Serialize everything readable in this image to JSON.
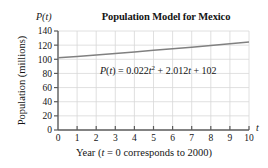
{
  "chart_data": {
    "type": "line",
    "title": "Population Model for Mexico",
    "xlabel": "Year (t = 0 corresponds to 2000)",
    "ylabel": "Population (millions)",
    "x_axis_symbol": "t",
    "y_axis_symbol": "P(t)",
    "xlim": [
      0,
      10
    ],
    "ylim": [
      0,
      140
    ],
    "xticks": [
      "0",
      "1",
      "2",
      "3",
      "4",
      "5",
      "6",
      "7",
      "8",
      "9",
      "10"
    ],
    "yticks": [
      "0",
      "20",
      "40",
      "60",
      "80",
      "100",
      "120",
      "140"
    ],
    "grid": true,
    "legend": "none",
    "annotation": "P(t) = 0.022t² + 2.012t + 102",
    "equation_parts": {
      "lhs_p": "P",
      "lhs_open": "(",
      "lhs_var": "t",
      "lhs_close": ")",
      "equals": "=",
      "a_coef": "0.022",
      "a_var": "t",
      "a_exp": "2",
      "plus1": "+",
      "b_coef": "2.012",
      "b_var": "t",
      "plus2": "+",
      "c_const": "102"
    },
    "series": [
      {
        "name": "P(t) = 0.022t^2 + 2.012t + 102",
        "color": "#808080",
        "x": [
          0,
          1,
          2,
          3,
          4,
          5,
          6,
          7,
          8,
          9,
          10
        ],
        "values": [
          102.0,
          104.03,
          106.11,
          108.23,
          110.4,
          112.61,
          114.86,
          117.16,
          119.5,
          121.89,
          124.32
        ]
      }
    ],
    "caption_parts": {
      "year_word": "Year (",
      "t_sym": "t",
      "rest": " = 0 corresponds to 2000)"
    }
  },
  "style": {
    "axis_color": "#5a5a5a",
    "grid_color": "#d8d8d8",
    "curve_color": "#808080",
    "text_color": "#141414",
    "background": "#ffffff"
  }
}
